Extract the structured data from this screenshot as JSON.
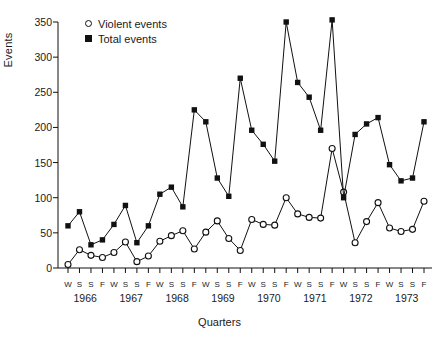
{
  "chart_data": {
    "type": "line",
    "title": "",
    "xlabel": "Quarters",
    "ylabel": "Events",
    "ylim": [
      0,
      350
    ],
    "yticks": [
      0,
      50,
      100,
      150,
      200,
      250,
      300,
      350
    ],
    "grid": false,
    "legend_position": "top-left",
    "categories": [
      "W 1966",
      "S 1966",
      "S 1966",
      "F 1966",
      "W 1967",
      "S 1967",
      "S 1967",
      "F 1967",
      "W 1968",
      "S 1968",
      "S 1968",
      "F 1968",
      "W 1969",
      "S 1969",
      "S 1969",
      "F 1969",
      "W 1970",
      "S 1970",
      "S 1970",
      "F 1970",
      "W 1971",
      "S 1971",
      "S 1971",
      "F 1971",
      "W 1972",
      "S 1972",
      "S 1972",
      "F 1972",
      "W 1973",
      "S 1973",
      "S 1973",
      "F 1973"
    ],
    "season_ticks": [
      "W",
      "S",
      "S",
      "F",
      "W",
      "S",
      "S",
      "F",
      "W",
      "S",
      "S",
      "F",
      "W",
      "S",
      "S",
      "F",
      "W",
      "S",
      "S",
      "F",
      "W",
      "S",
      "S",
      "F",
      "W",
      "S",
      "S",
      "F",
      "W",
      "S",
      "S",
      "F"
    ],
    "year_labels": [
      "1966",
      "1967",
      "1968",
      "1969",
      "1970",
      "1971",
      "1972",
      "1973"
    ],
    "series": [
      {
        "name": "Violent events",
        "marker": "open-circle",
        "color": "#111111",
        "values": [
          5,
          26,
          18,
          15,
          22,
          37,
          9,
          17,
          38,
          46,
          53,
          27,
          51,
          67,
          42,
          25,
          69,
          62,
          61,
          100,
          77,
          72,
          71,
          170,
          108,
          36,
          66,
          93,
          57,
          52,
          55,
          95
        ]
      },
      {
        "name": "Total events",
        "marker": "filled-square",
        "color": "#111111",
        "values": [
          60,
          80,
          33,
          40,
          62,
          89,
          36,
          60,
          105,
          115,
          87,
          225,
          208,
          128,
          102,
          270,
          196,
          176,
          152,
          350,
          264,
          243,
          196,
          353,
          100,
          190,
          205,
          214,
          147,
          124,
          128,
          208
        ]
      }
    ]
  },
  "legend": {
    "items": [
      {
        "label": "Violent events",
        "marker": "open-circle"
      },
      {
        "label": "Total events",
        "marker": "filled-square"
      }
    ]
  }
}
